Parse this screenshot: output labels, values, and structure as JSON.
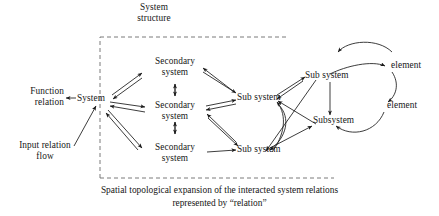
{
  "diagram": {
    "title_label": "System\nstructure",
    "caption_line1": "Spatial topological expansion of the interacted system relations",
    "caption_line2": "represented by “relation”",
    "stroke_color": "#1a1a1a",
    "dashed_color": "#6b6b6b",
    "background": "#ffffff"
  },
  "left_labels": {
    "function_relation": "Function\nrelation",
    "input_relation_flow": "Input relation\nflow",
    "system": "System"
  },
  "nodes": {
    "secondary_top": "Secondary\nsystem",
    "secondary_mid": "Secondary\nsystem",
    "secondary_bottom": "Secondary\nsystem",
    "sub_system_upper": "Sub system",
    "sub_system_lower": "Sub system",
    "sub_system_right": "Sub system",
    "subsystem_right": "Subsystem",
    "element_top": "element",
    "element_bottom": "element"
  },
  "boundary": {
    "label": "System structure boundary",
    "style": "dashed",
    "left": 100,
    "top": 37,
    "right": 334,
    "bottom": 178
  }
}
